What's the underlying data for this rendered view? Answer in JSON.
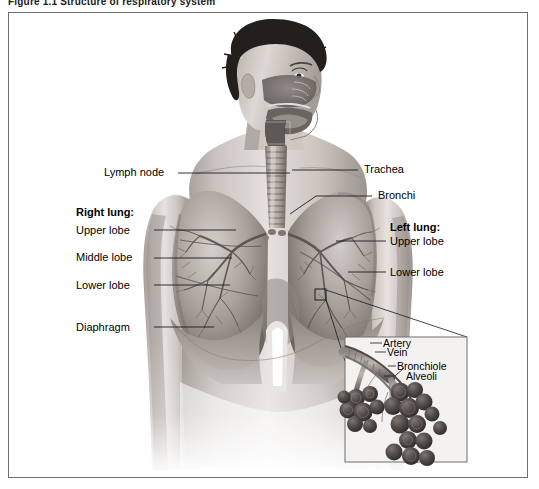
{
  "figure": {
    "caption": "Figure 1.1   Structure of respiratory system",
    "type": "anatomical-illustration",
    "style": "grayscale airbrush medical illustration",
    "border_color": "#6f6f6f"
  },
  "labels": {
    "lymph_node": "Lymph node",
    "right_lung_heading": "Right lung:",
    "right_upper_lobe": "Upper lobe",
    "right_middle_lobe": "Middle lobe",
    "right_lower_lobe": "Lower lobe",
    "diaphragm": "Diaphragm",
    "trachea": "Trachea",
    "bronchi": "Bronchi",
    "left_lung_heading": "Left lung:",
    "left_upper_lobe": "Upper lobe",
    "left_lower_lobe": "Lower lobe"
  },
  "inset": {
    "artery": "Artery",
    "vein": "Vein",
    "bronchiole": "Bronchiole",
    "alveoli": "Alveoli"
  },
  "colors": {
    "ink": "#000000",
    "leader_line": "#1b1b1b",
    "skin_light": "#e3dedb",
    "skin_mid": "#bdb5b0",
    "skin_shadow": "#8e8782",
    "lung_light": "#cfc9c5",
    "lung_mid": "#9d9691",
    "lung_dark": "#6e6863",
    "hair": "#231f1d",
    "trachea": "#b9b2ad",
    "alveoli_dark": "#4a4542",
    "inset_bg": "#f4f2f1"
  }
}
